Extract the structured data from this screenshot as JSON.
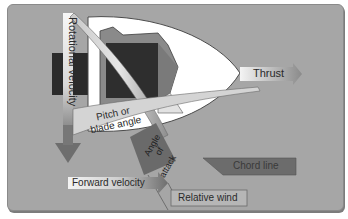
{
  "diagram": {
    "labels": {
      "rotational_velocity": "Rotational velocity",
      "thrust": "Thrust",
      "pitch_line1": "Pitch or",
      "pitch_line2": "blade angle",
      "aoa_line1": "Angle",
      "aoa_line2": "of",
      "aoa_line3": "attack",
      "chord_line": "Chord line",
      "forward_velocity": "Forward velocity",
      "relative_wind": "Relative wind"
    },
    "colors": {
      "background": "#a6a6a6",
      "spinner": "#ffffff",
      "hub_dark": "#2b2b2b",
      "arrow_dark": "#6e6e6e",
      "label_box": "#f2f2f2"
    }
  }
}
